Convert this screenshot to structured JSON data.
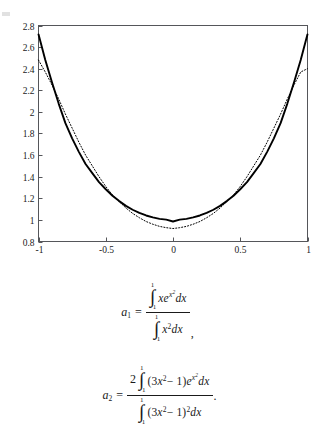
{
  "chart_data": {
    "type": "line",
    "title": "",
    "xlabel": "",
    "ylabel": "",
    "xlim": [
      -1,
      1
    ],
    "ylim": [
      0.8,
      2.8
    ],
    "grid": false,
    "legend": null,
    "xticks": [
      "-1",
      "-0.5",
      "0",
      "0.5",
      "1"
    ],
    "xtick_values": [
      -1,
      -0.5,
      0,
      0.5,
      1
    ],
    "yticks": [
      "0.8",
      "1",
      "1.2",
      "1.4",
      "1.6",
      "1.8",
      "2",
      "2.2",
      "2.4",
      "2.6",
      "2.8"
    ],
    "ytick_values": [
      0.8,
      1,
      1.2,
      1.4,
      1.6,
      1.8,
      2,
      2.2,
      2.4,
      2.6,
      2.8
    ],
    "series": [
      {
        "name": "exact",
        "style": "solid",
        "color": "#000000",
        "x": [
          -1,
          -0.95,
          -0.9,
          -0.85,
          -0.8,
          -0.75,
          -0.7,
          -0.65,
          -0.6,
          -0.55,
          -0.5,
          -0.45,
          -0.4,
          -0.35,
          -0.3,
          -0.25,
          -0.2,
          -0.15,
          -0.1,
          -0.05,
          0,
          0.05,
          0.1,
          0.15,
          0.2,
          0.25,
          0.3,
          0.35,
          0.4,
          0.45,
          0.5,
          0.55,
          0.6,
          0.65,
          0.7,
          0.75,
          0.8,
          0.85,
          0.9,
          0.95,
          1
        ],
        "y": [
          2.718,
          2.482,
          2.274,
          2.077,
          1.896,
          1.755,
          1.63,
          1.518,
          1.433,
          1.35,
          1.284,
          1.224,
          1.174,
          1.13,
          1.094,
          1.065,
          1.041,
          1.023,
          1.01,
          1.002,
          0.985,
          1.002,
          1.01,
          1.023,
          1.041,
          1.065,
          1.094,
          1.13,
          1.174,
          1.224,
          1.284,
          1.35,
          1.433,
          1.518,
          1.63,
          1.755,
          1.896,
          2.077,
          2.274,
          2.482,
          2.718
        ]
      },
      {
        "name": "approximation",
        "style": "dotted",
        "color": "#000000",
        "x": [
          -1,
          -0.95,
          -0.9,
          -0.85,
          -0.8,
          -0.75,
          -0.7,
          -0.65,
          -0.6,
          -0.55,
          -0.5,
          -0.45,
          -0.4,
          -0.35,
          -0.3,
          -0.25,
          -0.2,
          -0.15,
          -0.1,
          -0.05,
          0,
          0.05,
          0.1,
          0.15,
          0.2,
          0.25,
          0.3,
          0.35,
          0.4,
          0.45,
          0.5,
          0.55,
          0.6,
          0.65,
          0.7,
          0.75,
          0.8,
          0.85,
          0.9,
          0.95,
          1
        ],
        "y": [
          2.48,
          2.37,
          2.25,
          2.12,
          1.98,
          1.85,
          1.72,
          1.6,
          1.5,
          1.4,
          1.31,
          1.23,
          1.17,
          1.11,
          1.06,
          1.02,
          0.985,
          0.96,
          0.94,
          0.928,
          0.92,
          0.928,
          0.94,
          0.96,
          0.985,
          1.02,
          1.06,
          1.11,
          1.17,
          1.23,
          1.31,
          1.4,
          1.5,
          1.6,
          1.72,
          1.85,
          1.98,
          2.12,
          2.25,
          2.37,
          2.4
        ]
      }
    ]
  },
  "equations": {
    "a1": {
      "lhs": "a",
      "lhs_sub": "1",
      "eq": "=",
      "numerator": {
        "int_upper": "1",
        "int_symbol": "∫",
        "int_lower": "−1",
        "integrand_base": "xe",
        "integrand_exp_base": "x",
        "integrand_exp_exp": "2",
        "integrand_dx": "dx"
      },
      "denominator": {
        "int_upper": "1",
        "int_symbol": "∫",
        "int_lower": "−1",
        "integrand_base": "x",
        "integrand_sup": "2",
        "integrand_dx": "dx"
      },
      "trailing_punct": ","
    },
    "a2": {
      "lhs": "a",
      "lhs_sub": "2",
      "eq": "=",
      "lead_coefficient": "2",
      "numerator": {
        "int_upper": "1",
        "int_symbol": "∫",
        "int_lower": "−1",
        "integrand_paren_open": "(3",
        "integrand_x": "x",
        "integrand_sup": "2",
        "integrand_minus": "− 1)",
        "integrand_e": "e",
        "integrand_exp_base": "x",
        "integrand_exp_exp": "2",
        "integrand_dx": "dx"
      },
      "denominator": {
        "int_upper": "1",
        "int_symbol": "∫",
        "int_lower": "−1",
        "integrand_paren_open": "(3",
        "integrand_x": "x",
        "integrand_sup": "2",
        "integrand_minus": "− 1)",
        "integrand_sup2": "2",
        "integrand_dx": "dx"
      },
      "trailing_punct": "."
    }
  }
}
